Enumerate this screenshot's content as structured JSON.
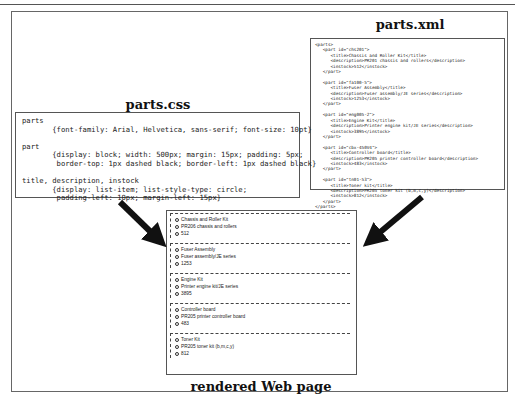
{
  "page_header_fragment": "…",
  "xml_panel": {
    "title": "parts.xml",
    "code": "<parts>\n   <part id=\"chs201\">\n      <title>Chassis and Roller Kit</title>\n      <description>PR201 chassis and rollers</description>\n      <instock>512</instock>\n   </part>\n\n   <part id=\"fa100-5\">\n      <title>Fuser Assembly</title>\n      <description>Fuser assembly/JE series</description>\n      <instock>1253</instock>\n   </part>\n\n   <part id=\"eng005-2\">\n      <title>Engine Kit</title>\n      <description>Printer engine kit/JE series</description>\n      <instock>3895</instock>\n   </part>\n\n   <part id=\"cbx-450V4\">\n      <title>Controller board</title>\n      <description>PR205 printer controller board</description>\n      <instock>483</instock>\n   </part>\n\n   <part id=\"tn01-53\">\n      <title>Toner kit</title>\n      <description>PR205 toner kit (b,m,c,y)</description>\n      <instock>812</instock>\n   </part>\n</parts>"
  },
  "css_panel": {
    "title": "parts.css",
    "code": "parts\n       {font-family: Arial, Helvetica, sans-serif; font-size: 10pt}\n\npart\n       {display: block; width: 500px; margin: 15px; padding: 5px;\n        border-top: 1px dashed black; border-left: 1px dashed black}\n\ntitle, description, instock\n       {display: list-item; list-style-type: circle;\n        padding-left: 10px; margin-left: 15px}"
  },
  "rendered_panel": {
    "caption": "rendered Web page",
    "parts": [
      {
        "title": "Chassis and Roller Kit",
        "description": "PR206 chassis and rollers",
        "instock": "512"
      },
      {
        "title": "Fuser Assembly",
        "description": "Fuser assembly/JE series",
        "instock": "1253"
      },
      {
        "title": "Engine Kit",
        "description": "Printer engine kit/JE series",
        "instock": "3895"
      },
      {
        "title": "Controller board",
        "description": "PR205 printer controller board",
        "instock": "483"
      },
      {
        "title": "Toner Kit",
        "description": "PR205 toner kit (b,m,c,y)",
        "instock": "812"
      }
    ]
  },
  "arrows": [
    {
      "from": "parts.css",
      "to": "rendered Web page"
    },
    {
      "from": "parts.xml",
      "to": "rendered Web page"
    }
  ]
}
